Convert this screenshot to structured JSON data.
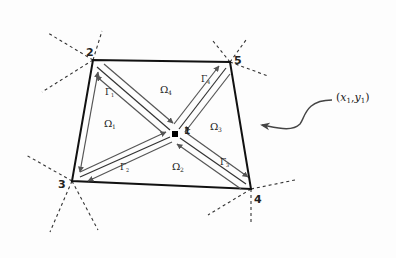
{
  "diagram": {
    "nodes": [
      {
        "id": "1",
        "label": "1",
        "role": "interior"
      },
      {
        "id": "2",
        "label": "2",
        "role": "corner"
      },
      {
        "id": "3",
        "label": "3",
        "role": "corner"
      },
      {
        "id": "4",
        "label": "4",
        "role": "corner"
      },
      {
        "id": "5",
        "label": "5",
        "role": "corner"
      }
    ],
    "subdomains": [
      {
        "id": "omega1",
        "symbol": "Ω",
        "subscript": "1"
      },
      {
        "id": "omega2",
        "symbol": "Ω",
        "subscript": "2"
      },
      {
        "id": "omega3",
        "symbol": "Ω",
        "subscript": "3"
      },
      {
        "id": "omega4",
        "symbol": "Ω",
        "subscript": "4"
      }
    ],
    "boundaries": [
      {
        "id": "gamma1",
        "symbol": "Γ",
        "subscript": "1",
        "between": [
          "1",
          "2"
        ]
      },
      {
        "id": "gamma2",
        "symbol": "Γ",
        "subscript": "2",
        "between": [
          "1",
          "3"
        ]
      },
      {
        "id": "gamma3",
        "symbol": "Γ",
        "subscript": "3",
        "between": [
          "1",
          "4"
        ]
      },
      {
        "id": "gamma4",
        "symbol": "Γ",
        "subscript": "4",
        "between": [
          "1",
          "5"
        ]
      }
    ],
    "annotation": {
      "text_open": "(",
      "x": "x",
      "x_sub": "1",
      "comma": ",",
      "y": "y",
      "y_sub": "1",
      "text_close": ")"
    },
    "colors": {
      "edge": "#111111",
      "arrow": "#555555",
      "dashed": "#333333"
    }
  }
}
